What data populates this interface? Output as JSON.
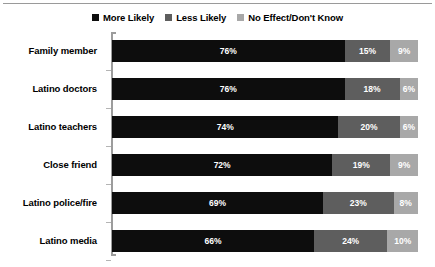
{
  "chart_data": {
    "type": "bar",
    "orientation": "horizontal",
    "stacked": true,
    "stack_total": 100,
    "title": "",
    "subtitle": "",
    "xlabel": "",
    "ylabel": "",
    "xlim": [
      0,
      100
    ],
    "grid": false,
    "legend_position": "top-center",
    "categories": [
      "Family member",
      "Latino doctors",
      "Latino teachers",
      "Close friend",
      "Latino police/fire",
      "Latino media"
    ],
    "series": [
      {
        "name": "More Likely",
        "color": "#0d0d0d",
        "values": [
          76,
          76,
          74,
          72,
          69,
          66
        ],
        "labels": [
          "76%",
          "76%",
          "74%",
          "72%",
          "69%",
          "66%"
        ]
      },
      {
        "name": "Less Likely",
        "color": "#5e5e5e",
        "values": [
          15,
          18,
          20,
          19,
          23,
          24
        ],
        "labels": [
          "15%",
          "18%",
          "20%",
          "19%",
          "23%",
          "24%"
        ]
      },
      {
        "name": "No Effect/Don't Know",
        "color": "#a8a8a8",
        "values": [
          9,
          6,
          6,
          9,
          8,
          10
        ],
        "labels": [
          "9%",
          "6%",
          "6%",
          "9%",
          "8%",
          "10%"
        ]
      }
    ]
  },
  "legend": {
    "entries": [
      {
        "label": "More Likely",
        "color": "#0d0d0d"
      },
      {
        "label": "Less Likely",
        "color": "#5e5e5e"
      },
      {
        "label": "No Effect/Don't Know",
        "color": "#a8a8a8"
      }
    ]
  },
  "axis": {
    "line_color": "#9c9c9c",
    "tick_color": "#b4b4b4"
  },
  "style": {
    "background": "#ffffff",
    "label_color": "#000000",
    "value_label_color": "#ffffff",
    "top_rule_color": "#9a9a9a"
  }
}
